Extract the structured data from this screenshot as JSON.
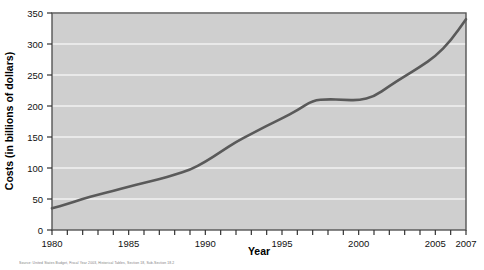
{
  "chart_data": {
    "type": "line",
    "title": "",
    "xlabel": "Year",
    "ylabel": "Costs (in billions of dollars)",
    "xlim": [
      1980,
      2007
    ],
    "ylim": [
      0,
      350
    ],
    "grid": "horizontal",
    "legend": "none",
    "line_color": "#5a5a5a",
    "plot_background": "#cfcfcf",
    "gridline_color": "#f2f2f2",
    "y_ticks": [
      0,
      50,
      100,
      150,
      200,
      250,
      300,
      350
    ],
    "y_tick_labels": [
      "0",
      "50",
      "100",
      "150",
      "200",
      "250",
      "300",
      "350"
    ],
    "x_ticks": [
      1980,
      1981,
      1982,
      1983,
      1984,
      1985,
      1986,
      1987,
      1988,
      1989,
      1990,
      1991,
      1992,
      1993,
      1994,
      1995,
      1996,
      1997,
      1998,
      1999,
      2000,
      2001,
      2002,
      2003,
      2004,
      2005,
      2006,
      2007
    ],
    "x_tick_labels": [
      "1980",
      "1985",
      "1990",
      "1995",
      "2000",
      "2005",
      "2007"
    ],
    "x_tick_label_years": [
      1980,
      1985,
      1990,
      1995,
      2000,
      2005,
      2007
    ],
    "x": [
      1980,
      1981,
      1982,
      1983,
      1984,
      1985,
      1986,
      1987,
      1988,
      1989,
      1990,
      1991,
      1992,
      1993,
      1994,
      1995,
      1996,
      1997,
      1998,
      1999,
      2000,
      2001,
      2002,
      2003,
      2004,
      2005,
      2006,
      2007
    ],
    "values": [
      35,
      42,
      50,
      57,
      63,
      70,
      76,
      82,
      89,
      97,
      110,
      126,
      142,
      155,
      168,
      180,
      193,
      209,
      211,
      210,
      209,
      215,
      232,
      248,
      263,
      280,
      305,
      340
    ],
    "annotations": []
  },
  "source": {
    "text": "Source: United States Budget, Fiscal Year 2003, Historical Tables, Section 18, Sub-Section 18.2"
  }
}
